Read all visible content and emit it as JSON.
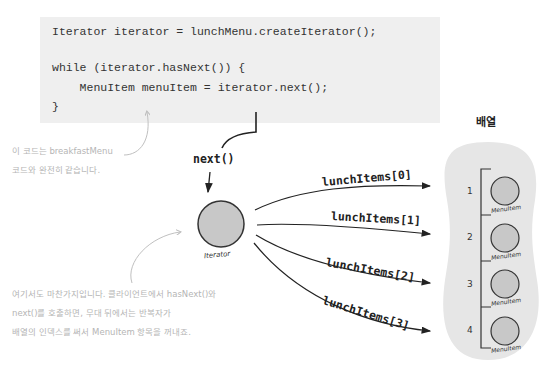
{
  "code": {
    "lines": [
      "Iterator iterator = lunchMenu.createIterator();",
      "",
      "while (iterator.hasNext()) {",
      "    MenuItem menuItem = iterator.next();",
      "}"
    ]
  },
  "annotations": {
    "top_note": [
      "이 코드는 breakfastMenu",
      "코드와 완전히 같습니다."
    ],
    "bottom_note": [
      "여기서도 마찬가지입니다. 클라이언트에서 hasNext()와",
      "next()를 호출하면, 무대 뒤에서는 반복자가",
      "배열의 인덱스를 써서 MenuItem 항목을 꺼내죠."
    ]
  },
  "diagram": {
    "next_label": "next()",
    "iterator_label": "Iterator",
    "array_title": "배열",
    "arrows": [
      "lunchItems[0]",
      "lunchItems[1]",
      "lunchItems[2]",
      "lunchItems[3]"
    ],
    "slots": [
      {
        "index": "1",
        "label": "MenuItem"
      },
      {
        "index": "2",
        "label": "MenuItem"
      },
      {
        "index": "3",
        "label": "MenuItem"
      },
      {
        "index": "4",
        "label": "MenuItem"
      }
    ]
  },
  "colors": {
    "code_bg": "#efefef",
    "node_fill": "#c8c8c8",
    "array_bg": "#e6e6e6",
    "note_text": "#b5b5b5"
  }
}
